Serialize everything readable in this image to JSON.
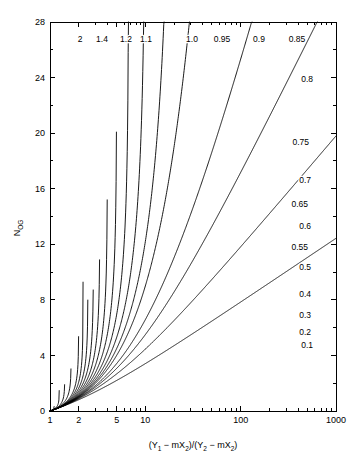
{
  "chart_data": {
    "type": "line",
    "title": "",
    "xlabel": "(Y1 - mX2)/(Y2 - mX2)",
    "ylabel": "NOG",
    "xscale": "log",
    "yscale": "linear",
    "xlim": [
      1,
      1000
    ],
    "ylim": [
      0,
      28
    ],
    "grid": false,
    "legend_position": "inline-curve-labels",
    "x_major_ticks": [
      1,
      2,
      5,
      10,
      100,
      1000
    ],
    "x_major_tick_labels": [
      "1",
      "2",
      "5",
      "10",
      "100",
      "1000"
    ],
    "x_minor_ticks": [
      3,
      4,
      6,
      7,
      8,
      9,
      20,
      30,
      40,
      50,
      60,
      70,
      80,
      90,
      200,
      300,
      400,
      500,
      600,
      700,
      800,
      900
    ],
    "y_major_ticks": [
      0,
      4,
      8,
      12,
      16,
      20,
      24,
      28
    ],
    "y_major_tick_labels": [
      "0",
      "4",
      "8",
      "12",
      "16",
      "20",
      "24",
      "28"
    ],
    "y_minor_ticks": [
      2,
      6,
      10,
      14,
      18,
      22,
      26
    ],
    "equation_note": "NOG = ln[(1 - 1/A)X + 1/A] / (1 - 1/A)",
    "series": [
      {
        "name": "2",
        "A": 2.0,
        "label": "2",
        "label_pos": "top",
        "label_x": 80,
        "label_y": 42
      },
      {
        "name": "1.4",
        "A": 1.4,
        "label": "1.4",
        "label_pos": "top",
        "label_x": 102,
        "label_y": 42
      },
      {
        "name": "1.2",
        "A": 1.2,
        "label": "1.2",
        "label_pos": "top",
        "label_x": 126,
        "label_y": 42
      },
      {
        "name": "1.1",
        "A": 1.1,
        "label": "1.1",
        "label_pos": "top",
        "label_x": 146,
        "label_y": 42
      },
      {
        "name": "1.0",
        "A": 1.0,
        "label": "1.0",
        "label_pos": "top",
        "label_x": 192,
        "label_y": 42
      },
      {
        "name": "0.95",
        "A": 0.95,
        "label": "0.95",
        "label_pos": "top",
        "label_x": 222,
        "label_y": 42
      },
      {
        "name": "0.9",
        "A": 0.9,
        "label": "0.9",
        "label_pos": "top",
        "label_x": 259,
        "label_y": 42
      },
      {
        "name": "0.85",
        "A": 0.85,
        "label": "0.85",
        "label_pos": "top",
        "label_x": 297,
        "label_y": 42
      },
      {
        "name": "0.8",
        "A": 0.8,
        "label": "0.8",
        "label_pos": "right",
        "label_x": 313,
        "label_y": 82
      },
      {
        "name": "0.75",
        "A": 0.75,
        "label": "0.75",
        "label_pos": "right",
        "label_x": 309,
        "label_y": 145
      },
      {
        "name": "0.7",
        "A": 0.7,
        "label": "0.7",
        "label_pos": "right",
        "label_x": 311,
        "label_y": 183
      },
      {
        "name": "0.65",
        "A": 0.65,
        "label": "0.65",
        "label_pos": "right",
        "label_x": 308,
        "label_y": 207
      },
      {
        "name": "0.6",
        "A": 0.6,
        "label": "0.6",
        "label_pos": "right",
        "label_x": 311,
        "label_y": 229
      },
      {
        "name": "0.55",
        "A": 0.55,
        "label": "0.55",
        "label_pos": "right",
        "label_x": 308,
        "label_y": 250
      },
      {
        "name": "0.5",
        "A": 0.5,
        "label": "0.5",
        "label_pos": "right",
        "label_x": 311,
        "label_y": 270
      },
      {
        "name": "0.4",
        "A": 0.4,
        "label": "0.4",
        "label_pos": "right",
        "label_x": 311,
        "label_y": 297
      },
      {
        "name": "0.3",
        "A": 0.3,
        "label": "0.3",
        "label_pos": "right",
        "label_x": 311,
        "label_y": 318
      },
      {
        "name": "0.2",
        "A": 0.2,
        "label": "0.2",
        "label_pos": "right",
        "label_x": 311,
        "label_y": 335
      },
      {
        "name": "0.1",
        "A": 0.1,
        "label": "0.1",
        "label_pos": "right",
        "label_x": 313,
        "label_y": 348
      }
    ]
  },
  "axes": {
    "y_title_main": "N",
    "y_title_sub": "OG",
    "x_title_parts": {
      "open1": "(Y",
      "sub1": "1",
      "mid1": " − mX",
      "sub2": "2",
      "close1": ")/(Y",
      "sub3": "2",
      "mid2": " − mX",
      "sub4": "2",
      "close2": ")"
    }
  },
  "style": {
    "axis_color": "#000000",
    "curve_color": "#000000",
    "background": "#ffffff"
  },
  "geometry": {
    "plot_left": 50,
    "plot_right": 336,
    "plot_top": 22,
    "plot_bottom": 411
  }
}
